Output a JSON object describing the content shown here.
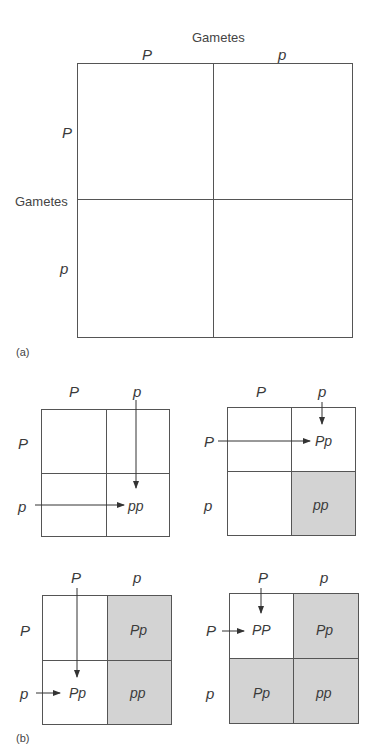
{
  "panel_a": {
    "label": "(a)",
    "top_header": "Gametes",
    "side_header": "Gametes",
    "columns": [
      "P",
      "p"
    ],
    "rows": [
      "P",
      "p"
    ],
    "cells": [
      [
        "",
        ""
      ],
      [
        "",
        ""
      ]
    ]
  },
  "panel_b": {
    "label": "(b)",
    "grids": [
      {
        "columns": [
          "P",
          "p"
        ],
        "rows": [
          "P",
          "p"
        ],
        "cells": [
          [
            "",
            ""
          ],
          [
            "",
            "pp"
          ]
        ],
        "shaded": [
          [
            false,
            false
          ],
          [
            false,
            false
          ]
        ],
        "highlight": "pp (p × p)"
      },
      {
        "columns": [
          "P",
          "p"
        ],
        "rows": [
          "P",
          "p"
        ],
        "cells": [
          [
            "",
            "Pp"
          ],
          [
            "",
            "pp"
          ]
        ],
        "shaded": [
          [
            false,
            false
          ],
          [
            false,
            true
          ]
        ],
        "highlight": "Pp (P × p)"
      },
      {
        "columns": [
          "P",
          "p"
        ],
        "rows": [
          "P",
          "p"
        ],
        "cells": [
          [
            "",
            "Pp"
          ],
          [
            "Pp",
            "pp"
          ]
        ],
        "shaded": [
          [
            false,
            true
          ],
          [
            false,
            true
          ]
        ],
        "highlight": "Pp (p × P)"
      },
      {
        "columns": [
          "P",
          "p"
        ],
        "rows": [
          "P",
          "p"
        ],
        "cells": [
          [
            "PP",
            "Pp"
          ],
          [
            "Pp",
            "pp"
          ]
        ],
        "shaded": [
          [
            false,
            true
          ],
          [
            true,
            true
          ]
        ],
        "highlight": "PP (P × P)"
      }
    ]
  },
  "colors": {
    "shade": "#d3d3d3",
    "line": "#555555"
  }
}
